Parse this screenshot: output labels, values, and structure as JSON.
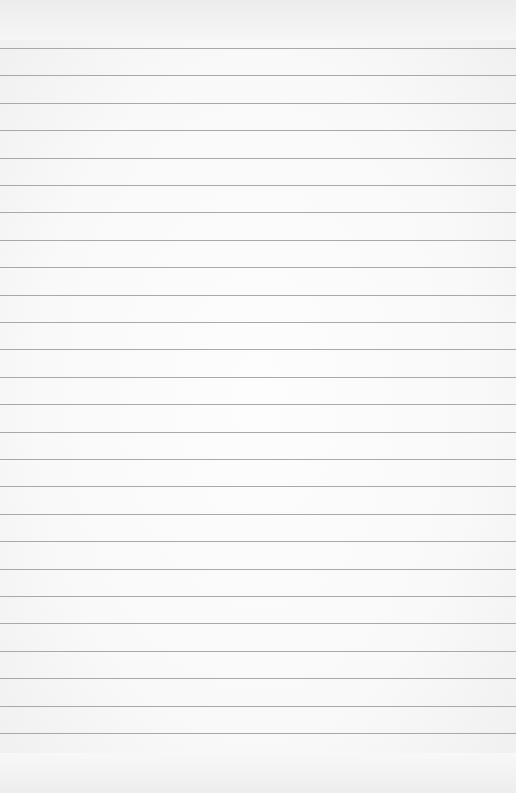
{
  "paper": {
    "type": "ruled-notebook-paper",
    "background_color": "#fafafa",
    "rule_color": "#a9a9a9",
    "rule_count": 26,
    "first_rule_y": 48,
    "rule_spacing_px": 27.4
  }
}
